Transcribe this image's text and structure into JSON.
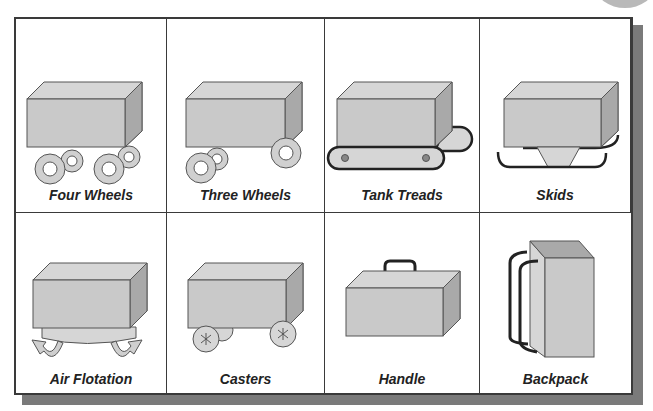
{
  "colors": {
    "box_front": "#c9c9c9",
    "box_top": "#d6d6d6",
    "box_side": "#a9a9a9",
    "outline": "#555555",
    "dark_part": "#2a2a2a",
    "grid_border": "#3a3a3a",
    "shadow": "#7a7a7a"
  },
  "cells": [
    {
      "id": "four-wheels",
      "label": "Four Wheels",
      "icon": "box-with-four-wheels"
    },
    {
      "id": "three-wheels",
      "label": "Three Wheels",
      "icon": "box-with-three-wheels"
    },
    {
      "id": "tank-treads",
      "label": "Tank Treads",
      "icon": "box-on-tank-treads"
    },
    {
      "id": "skids",
      "label": "Skids",
      "icon": "box-on-skids"
    },
    {
      "id": "air-flotation",
      "label": "Air Flotation",
      "icon": "box-on-air-cushion"
    },
    {
      "id": "casters",
      "label": "Casters",
      "icon": "box-on-casters"
    },
    {
      "id": "handle",
      "label": "Handle",
      "icon": "box-with-handle"
    },
    {
      "id": "backpack",
      "label": "Backpack",
      "icon": "box-with-backpack-straps"
    }
  ]
}
